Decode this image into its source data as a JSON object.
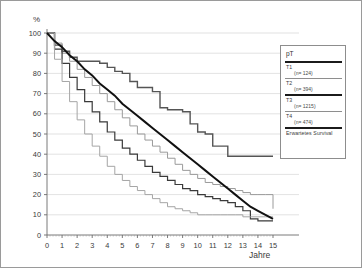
{
  "figure": {
    "y_axis_title": "%",
    "x_axis_title": "Jahre"
  },
  "legend": {
    "title": "pT",
    "entries": [
      {
        "label": "T1",
        "n": "(n= 124)",
        "style": "thick-dark"
      },
      {
        "label": "T2",
        "n": "(n= 394)",
        "style": "thin-gray"
      },
      {
        "label": "T3",
        "n": "(n= 1215)",
        "style": "thick-dark"
      },
      {
        "label": "T4",
        "n": "(n= 474)",
        "style": "thin-gray"
      },
      {
        "label": "Erwartetes Survival",
        "n": "",
        "style": "thick-black"
      }
    ]
  },
  "chart_data": {
    "type": "line",
    "title": "",
    "xlabel": "Jahre",
    "ylabel": "%",
    "xlim": [
      0,
      15
    ],
    "ylim": [
      0,
      100
    ],
    "xticks": [
      0,
      1,
      2,
      3,
      4,
      5,
      6,
      7,
      8,
      9,
      10,
      11,
      12,
      13,
      14,
      15
    ],
    "yticks": [
      0,
      10,
      20,
      30,
      40,
      50,
      60,
      70,
      80,
      90,
      100
    ],
    "grid": "horizontal",
    "legend_position": "right-outside",
    "x": [
      0,
      0.5,
      1,
      1.5,
      2,
      2.5,
      3,
      3.5,
      4,
      4.5,
      5,
      5.5,
      6,
      6.5,
      7,
      7.5,
      8,
      8.5,
      9,
      9.5,
      10,
      10.5,
      11,
      11.5,
      12,
      12.5,
      13,
      13.5,
      14,
      14.5,
      15
    ],
    "series": [
      {
        "name": "T1",
        "n": 124,
        "color": "#555555",
        "width": 1.4,
        "step": true,
        "values": [
          100,
          94,
          91,
          88,
          86,
          86,
          86,
          85,
          83,
          81,
          80,
          76,
          73,
          73,
          71,
          63,
          62,
          62,
          61,
          55,
          51,
          50,
          44,
          44,
          39,
          39,
          39,
          39,
          39,
          39,
          39
        ]
      },
      {
        "name": "T2",
        "n": 394,
        "color": "#9a9a9a",
        "width": 1.0,
        "step": true,
        "values": [
          100,
          95,
          90,
          86,
          82,
          78,
          74,
          70,
          66,
          62,
          58,
          54,
          50,
          47,
          44,
          41,
          38,
          35,
          32,
          30,
          28,
          26,
          25,
          24,
          23,
          22,
          21,
          20,
          20,
          20,
          13
        ]
      },
      {
        "name": "T3",
        "n": 1215,
        "color": "#3a3a3a",
        "width": 1.2,
        "step": true,
        "values": [
          100,
          92,
          85,
          78,
          72,
          66,
          61,
          56,
          51,
          47,
          43,
          40,
          37,
          34,
          31,
          29,
          27,
          25,
          23,
          22,
          20,
          19,
          18,
          17,
          16,
          14,
          12,
          8,
          7,
          7,
          7
        ]
      },
      {
        "name": "T4",
        "n": 474,
        "color": "#a5a5a5",
        "width": 1.0,
        "step": true,
        "values": [
          100,
          87,
          76,
          66,
          57,
          50,
          44,
          39,
          34,
          30,
          27,
          24,
          22,
          20,
          18,
          16,
          14,
          13,
          12,
          11,
          10,
          10,
          10,
          10,
          10,
          10,
          9,
          9,
          9,
          9,
          9
        ]
      },
      {
        "name": "Erwartetes Survival",
        "n": null,
        "color": "#111111",
        "width": 2.0,
        "step": false,
        "values": [
          100,
          96,
          93,
          89,
          86,
          82,
          79,
          75,
          72,
          69,
          65,
          62,
          59,
          56,
          53,
          50,
          47,
          44,
          41,
          38,
          35,
          32,
          29,
          26,
          23,
          20,
          17,
          14,
          12,
          10,
          8
        ]
      }
    ]
  }
}
